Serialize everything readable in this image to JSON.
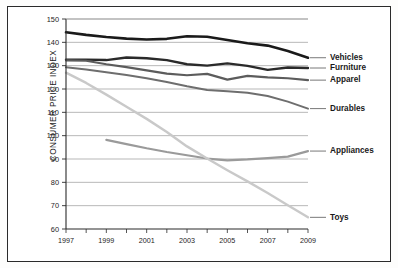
{
  "chart_data": {
    "type": "line",
    "title": "",
    "xlabel": "",
    "ylabel": "CONSUMER PRICE INDEX",
    "xlim": [
      1997,
      2009
    ],
    "ylim": [
      60,
      150
    ],
    "ytick_step": 10,
    "grid": true,
    "legend_position": "right-inline-labels",
    "yticks": [
      60,
      70,
      80,
      90,
      100,
      110,
      120,
      130,
      140,
      150
    ],
    "ytick_labels": [
      "60",
      "70",
      "80",
      "90",
      "100",
      "110",
      "120",
      "130",
      "140",
      "150"
    ],
    "xticks": [
      1997,
      1998,
      1999,
      2000,
      2001,
      2002,
      2003,
      2004,
      2005,
      2006,
      2007,
      2008,
      2009
    ],
    "xtick_labels": [
      "1997",
      "",
      "1999",
      "",
      "2001",
      "",
      "2003",
      "",
      "2005",
      "",
      "2007",
      "",
      "2009"
    ],
    "x": [
      1997,
      1998,
      1999,
      2000,
      2001,
      2002,
      2003,
      2004,
      2005,
      2006,
      2007,
      2008,
      2009
    ],
    "series": [
      {
        "name": "Vehicles",
        "color": "#1a1a1a",
        "width": 2.6,
        "values": [
          144.3,
          143.2,
          142.3,
          141.6,
          141.2,
          141.5,
          142.6,
          142.4,
          141.0,
          139.6,
          138.6,
          136.3,
          133.4
        ]
      },
      {
        "name": "Furniture",
        "color": "#2a2a2a",
        "width": 2.4,
        "values": [
          132.6,
          132.6,
          132.4,
          133.5,
          133.2,
          132.4,
          130.6,
          130.0,
          131.0,
          129.9,
          128.2,
          129.2,
          129.0
        ]
      },
      {
        "name": "Apparel",
        "color": "#5c5c5c",
        "width": 2.2,
        "values": [
          132.3,
          132.1,
          130.6,
          129.4,
          128.0,
          126.6,
          125.9,
          126.5,
          124.0,
          125.6,
          125.0,
          124.6,
          123.8
        ]
      },
      {
        "name": "Durables",
        "color": "#6e6e6e",
        "width": 2.0,
        "values": [
          129.3,
          128.4,
          127.2,
          126.0,
          124.6,
          123.0,
          121.2,
          119.6,
          119.0,
          118.4,
          117.0,
          114.6,
          111.6
        ]
      },
      {
        "name": "Appliances",
        "color": "#9a9a9a",
        "width": 2.2,
        "values": [
          null,
          null,
          98.2,
          96.4,
          94.6,
          93.0,
          91.6,
          90.2,
          89.4,
          89.8,
          90.4,
          91.0,
          93.4
        ]
      },
      {
        "name": "Toys",
        "color": "#c9c9c9",
        "width": 2.4,
        "values": [
          127.0,
          122.6,
          117.6,
          112.4,
          107.2,
          101.6,
          95.4,
          90.2,
          85.2,
          80.4,
          75.4,
          70.2,
          65.0
        ]
      }
    ],
    "series_labels": [
      {
        "text": "Vehicles",
        "y_value": 133.4
      },
      {
        "text": "Furniture",
        "y_value": 129.0
      },
      {
        "text": "Apparel",
        "y_value": 123.8
      },
      {
        "text": "Durables",
        "y_value": 111.6
      },
      {
        "text": "Appliances",
        "y_value": 93.4
      },
      {
        "text": "Toys",
        "y_value": 65.0
      }
    ]
  }
}
